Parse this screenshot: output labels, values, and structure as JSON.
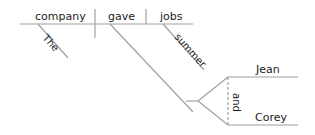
{
  "diagram": {
    "type": "sentence-diagram",
    "line_color": "#a0a0a0",
    "text_color": "#222222",
    "words": {
      "subject": "company",
      "verb": "gave",
      "direct_object": "jobs",
      "subject_modifier": "The",
      "object_modifier": "summer",
      "indirect_object_1": "Jean",
      "indirect_object_2": "Corey",
      "conjunction": "and"
    }
  }
}
